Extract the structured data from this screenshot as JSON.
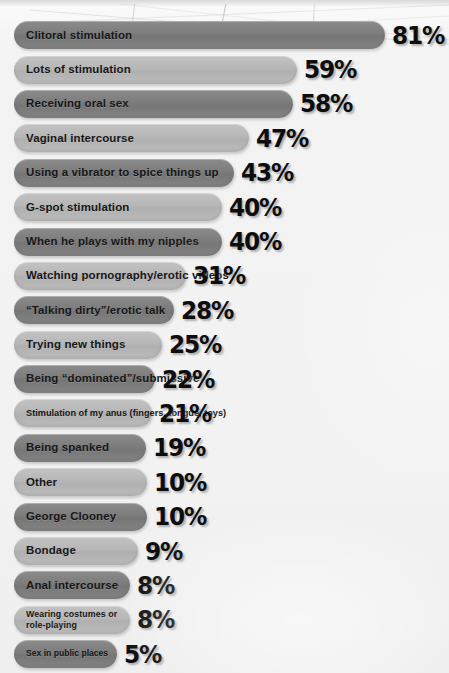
{
  "chart_data": {
    "type": "bar",
    "title": "",
    "subtitle": "",
    "xlabel": "",
    "ylabel": "",
    "orientation": "horizontal",
    "value_suffix": "%",
    "legend": [],
    "grid": false,
    "xlim": [
      0,
      100
    ],
    "categories": [
      "Clitoral stimulation",
      "Lots of stimulation",
      "Receiving oral sex",
      "Vaginal intercourse",
      "Using a vibrator to spice things up",
      "G-spot stimulation",
      "When he plays with my nipples",
      "Watching pornography/erotic videos",
      "“Talking dirty”/erotic talk",
      "Trying new things",
      "Being “dominated”/submissive",
      "Stimulation of my anus (fingers, tongue, toys)",
      "Being spanked",
      "Other",
      "George Clooney",
      "Bondage",
      "Anal intercourse",
      "Wearing costumes or role-playing",
      "Sex in public places",
      "“Dominating” him"
    ],
    "values": [
      81,
      59,
      58,
      47,
      43,
      40,
      40,
      31,
      28,
      25,
      22,
      21,
      19,
      10,
      10,
      9,
      8,
      8,
      5,
      3
    ]
  },
  "colors": {
    "bar_dark": "#7c7c7c",
    "bar_light": "#b6b6b6",
    "label_text": "#171717",
    "value_text": "#0d0d0d",
    "background": "#f2f2f2"
  },
  "rows": [
    {
      "label": "Clitoral stimulation",
      "value": "81%",
      "width": 371,
      "shade": "dark",
      "size": "normal"
    },
    {
      "label": "Lots of stimulation",
      "value": "59%",
      "width": 283,
      "shade": "light",
      "size": "normal"
    },
    {
      "label": "Receiving oral sex",
      "value": "58%",
      "width": 279,
      "shade": "dark",
      "size": "normal"
    },
    {
      "label": "Vaginal intercourse",
      "value": "47%",
      "width": 235,
      "shade": "light",
      "size": "normal"
    },
    {
      "label": "Using a vibrator to spice things up",
      "value": "43%",
      "width": 220,
      "shade": "dark",
      "size": "normal"
    },
    {
      "label": "G-spot stimulation",
      "value": "40%",
      "width": 208,
      "shade": "light",
      "size": "normal"
    },
    {
      "label": "When he plays with my nipples",
      "value": "40%",
      "width": 208,
      "shade": "dark",
      "size": "normal"
    },
    {
      "label": "Watching pornography/erotic videos",
      "value": "31%",
      "width": 172,
      "shade": "light",
      "size": "normal"
    },
    {
      "label": "“Talking dirty”/erotic talk",
      "value": "28%",
      "width": 160,
      "shade": "dark",
      "size": "normal"
    },
    {
      "label": "Trying new things",
      "value": "25%",
      "width": 148,
      "shade": "light",
      "size": "normal"
    },
    {
      "label": "Being “dominated”/submissive",
      "value": "22%",
      "width": 141,
      "shade": "dark",
      "size": "normal"
    },
    {
      "label": "Stimulation of my anus (fingers, tongue, toys)",
      "value": "21%",
      "width": 138,
      "shade": "light",
      "size": "small"
    },
    {
      "label": "Being spanked",
      "value": "19%",
      "width": 132,
      "shade": "dark",
      "size": "normal"
    },
    {
      "label": "Other",
      "value": "10%",
      "width": 133,
      "shade": "light",
      "size": "normal"
    },
    {
      "label": "George Clooney",
      "value": "10%",
      "width": 133,
      "shade": "dark",
      "size": "normal"
    },
    {
      "label": "Bondage",
      "value": "9%",
      "width": 124,
      "shade": "light",
      "size": "normal"
    },
    {
      "label": "Anal intercourse",
      "value": "8%",
      "width": 116,
      "shade": "dark",
      "size": "normal"
    },
    {
      "label": "Wearing costumes or\nrole-playing",
      "value": "8%",
      "width": 116,
      "shade": "light",
      "size": "two-line"
    },
    {
      "label": "Sex in public places",
      "value": "5%",
      "width": 103,
      "shade": "dark",
      "size": "tiny"
    },
    {
      "label": "“Dominating” him",
      "value": "3%",
      "width": 89,
      "shade": "light",
      "size": "tiny"
    }
  ]
}
